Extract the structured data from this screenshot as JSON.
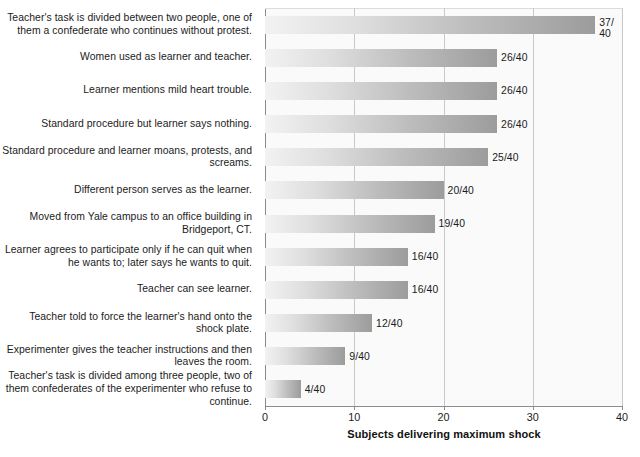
{
  "chart_data": {
    "type": "bar",
    "orientation": "horizontal",
    "title": "",
    "xlabel": "Subjects delivering maximum shock",
    "ylabel": "",
    "xlim": [
      0,
      40
    ],
    "xticks": [
      0,
      10,
      20,
      30,
      40
    ],
    "xticklabels": [
      "0",
      "10",
      "20",
      "30",
      "40"
    ],
    "gridlines": [
      10,
      20,
      30
    ],
    "grid": true,
    "legend": false,
    "denominator": 40,
    "categories": [
      "Teacher's task is divided between two people, one of them a confederate who continues without protest.",
      "Women used as learner and teacher.",
      "Learner mentions mild heart trouble.",
      "Standard procedure but learner says nothing.",
      "Standard procedure and learner moans, protests, and screams.",
      "Different person serves as the learner.",
      "Moved from Yale campus to an office building in Bridgeport, CT.",
      "Learner agrees to participate only if he can quit when he wants to; later says he wants to quit.",
      "Teacher can see learner.",
      "Teacher told to force the learner's hand onto the shock plate.",
      "Experimenter gives the teacher instructions and then leaves the room.",
      "Teacher's task is divided among three people, two of them confederates of the experimenter who refuse to continue."
    ],
    "values": [
      37,
      26,
      26,
      26,
      25,
      20,
      19,
      16,
      16,
      12,
      9,
      4
    ],
    "value_labels": [
      "37/\n40",
      "26/40",
      "26/40",
      "26/40",
      "25/40",
      "20/40",
      "19/40",
      "16/40",
      "16/40",
      "12/40",
      "9/40",
      "4/40"
    ]
  },
  "colors": {
    "bar_gradient_start": "#f2f2f2",
    "bar_gradient_end": "#9c9c9c",
    "plot_background": "#fafafa",
    "gridline": "#c9c9c9",
    "axis": "#8c8c8c",
    "text": "#1b1b1b"
  }
}
